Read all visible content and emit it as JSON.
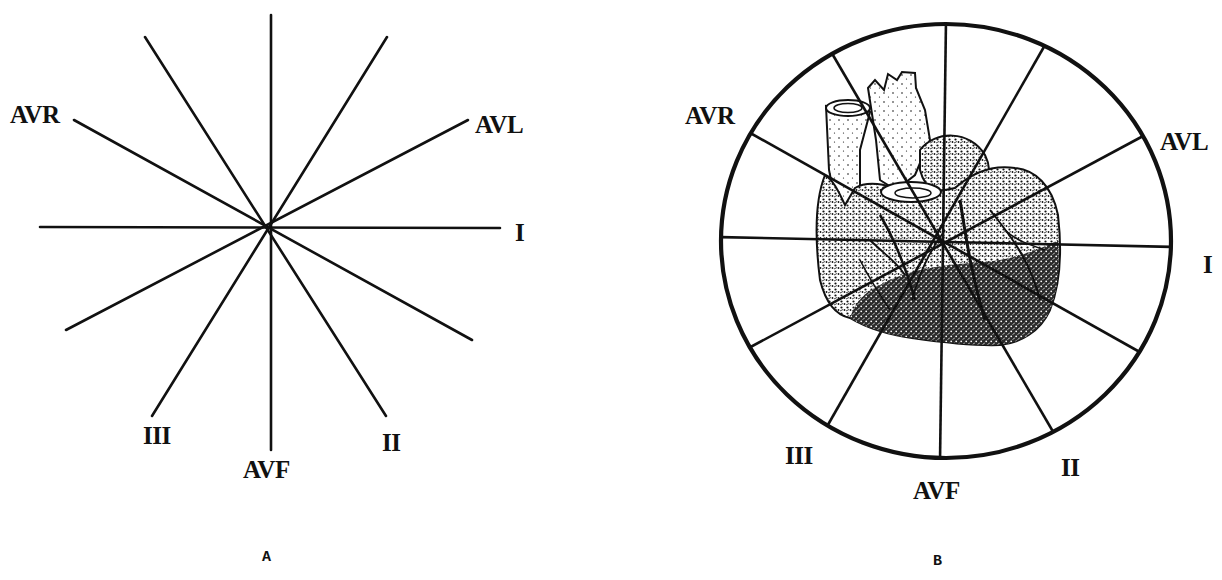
{
  "panels": [
    {
      "id": "A",
      "letter": "A",
      "description": "Hexaxial reference system: six frontal-plane lead axes drawn through a common center",
      "labels": {
        "avr": "AVR",
        "avl": "AVL",
        "i": "I",
        "ii": "II",
        "iii": "III",
        "avf": "AVF"
      }
    },
    {
      "id": "B",
      "letter": "B",
      "description": "Hexaxial reference system superimposed on a drawing of the heart, enclosed in a circle",
      "labels": {
        "avr": "AVR",
        "avl": "AVL",
        "i": "I",
        "ii": "II",
        "iii": "III",
        "avf": "AVF"
      }
    }
  ],
  "colors": {
    "ink": "#111111",
    "background": "#ffffff"
  }
}
